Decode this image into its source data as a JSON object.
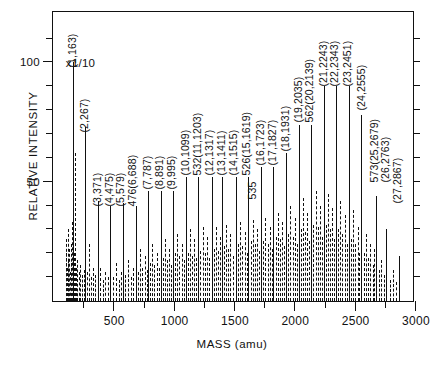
{
  "chart_data": {
    "type": "bar",
    "title": "",
    "xlabel": "MASS (amu)",
    "ylabel": "RELATIVE INTENSITY",
    "xlim": [
      0,
      3000
    ],
    "ylim": [
      0,
      122
    ],
    "grid": false,
    "legend": null,
    "annotations": [
      {
        "text": "x1/10",
        "x": 105,
        "y": 100
      }
    ],
    "xticks": [
      {
        "value": 500,
        "label": "500"
      },
      {
        "value": 1000,
        "label": "1000"
      },
      {
        "value": 1500,
        "label": "1500"
      },
      {
        "value": 2000,
        "label": "2000"
      },
      {
        "value": 2500,
        "label": "2500"
      },
      {
        "value": 3000,
        "label": "3000"
      }
    ],
    "xminor": [
      250,
      750,
      1250,
      1750,
      2250,
      2750
    ],
    "yticks": [
      {
        "value": 50,
        "label": "50"
      },
      {
        "value": 100,
        "label": "100"
      }
    ],
    "yminor": [
      10,
      20,
      30,
      40,
      60,
      70,
      80,
      90,
      110
    ],
    "peak_labels": [
      {
        "text": "(1,163)",
        "x": 163,
        "y": 103
      },
      {
        "text": "(2,267)",
        "x": 267,
        "y": 76
      },
      {
        "text": "(3,371)",
        "x": 371,
        "y": 45
      },
      {
        "text": "(4,475)",
        "x": 470,
        "y": 45
      },
      {
        "text": "(5,579)",
        "x": 566,
        "y": 45
      },
      {
        "text": "476(6,688)",
        "x": 664,
        "y": 45
      },
      {
        "text": "(7,787)",
        "x": 787,
        "y": 52
      },
      {
        "text": "(8,891)",
        "x": 888,
        "y": 52
      },
      {
        "text": "(9,995)",
        "x": 988,
        "y": 52
      },
      {
        "text": "(10,1099)",
        "x": 1099,
        "y": 58
      },
      {
        "text": "532(11,1203)",
        "x": 1200,
        "y": 58
      },
      {
        "text": "(12,1317)",
        "x": 1300,
        "y": 58
      },
      {
        "text": "(13,1411)",
        "x": 1398,
        "y": 58
      },
      {
        "text": "(14,1515)",
        "x": 1497,
        "y": 58
      },
      {
        "text": "526(15,1619)",
        "x": 1608,
        "y": 58
      },
      {
        "text": "535",
        "x": 1660,
        "y": 48
      },
      {
        "text": "(16,1723)",
        "x": 1723,
        "y": 62
      },
      {
        "text": "(17,1827)",
        "x": 1822,
        "y": 62
      },
      {
        "text": "(18,1931)",
        "x": 1931,
        "y": 68
      },
      {
        "text": "(19,2035)",
        "x": 2035,
        "y": 80
      },
      {
        "text": "562(20,2139)",
        "x": 2131,
        "y": 80
      },
      {
        "text": "(21,2243)",
        "x": 2243,
        "y": 95
      },
      {
        "text": "(22,2343)",
        "x": 2341,
        "y": 95
      },
      {
        "text": "(23,2451)",
        "x": 2445,
        "y": 95
      },
      {
        "text": "(24,2555)",
        "x": 2558,
        "y": 85
      },
      {
        "text": "573(25,2679)",
        "x": 2672,
        "y": 55
      },
      {
        "text": "(26,2763)",
        "x": 2762,
        "y": 55
      },
      {
        "text": "(27,2867)",
        "x": 2862,
        "y": 46
      }
    ],
    "peaks": [
      {
        "mass": 104,
        "intensity": 20,
        "style": "dash"
      },
      {
        "mass": 110,
        "intensity": 26,
        "style": "dash"
      },
      {
        "mass": 116,
        "intensity": 14,
        "style": "dash"
      },
      {
        "mass": 122,
        "intensity": 30,
        "style": "dash"
      },
      {
        "mass": 128,
        "intensity": 17,
        "style": "dash"
      },
      {
        "mass": 134,
        "intensity": 22,
        "style": "dash"
      },
      {
        "mass": 140,
        "intensity": 12,
        "style": "dash"
      },
      {
        "mass": 146,
        "intensity": 24,
        "style": "dash"
      },
      {
        "mass": 152,
        "intensity": 16,
        "style": "dash"
      },
      {
        "mass": 158,
        "intensity": 33,
        "style": "dash"
      },
      {
        "mass": 163,
        "intensity": 100,
        "style": "solid"
      },
      {
        "mass": 172,
        "intensity": 20,
        "style": "dash"
      },
      {
        "mass": 180,
        "intensity": 62,
        "style": "dash"
      },
      {
        "mass": 190,
        "intensity": 14,
        "style": "dash"
      },
      {
        "mass": 200,
        "intensity": 17,
        "style": "dash"
      },
      {
        "mass": 212,
        "intensity": 12,
        "style": "dash"
      },
      {
        "mass": 225,
        "intensity": 15,
        "style": "dash"
      },
      {
        "mass": 240,
        "intensity": 11,
        "style": "dash"
      },
      {
        "mass": 255,
        "intensity": 13,
        "style": "dash"
      },
      {
        "mass": 267,
        "intensity": 73,
        "style": "solid"
      },
      {
        "mass": 285,
        "intensity": 12,
        "style": "dash"
      },
      {
        "mass": 300,
        "intensity": 24,
        "style": "dash"
      },
      {
        "mass": 318,
        "intensity": 10,
        "style": "dash"
      },
      {
        "mass": 335,
        "intensity": 14,
        "style": "dash"
      },
      {
        "mass": 352,
        "intensity": 11,
        "style": "dash"
      },
      {
        "mass": 371,
        "intensity": 42,
        "style": "solid"
      },
      {
        "mass": 392,
        "intensity": 14,
        "style": "dash"
      },
      {
        "mass": 412,
        "intensity": 9,
        "style": "dash"
      },
      {
        "mass": 432,
        "intensity": 12,
        "style": "dash"
      },
      {
        "mass": 453,
        "intensity": 10,
        "style": "dash"
      },
      {
        "mass": 475,
        "intensity": 40,
        "style": "solid"
      },
      {
        "mass": 498,
        "intensity": 10,
        "style": "dash"
      },
      {
        "mass": 520,
        "intensity": 16,
        "style": "dash"
      },
      {
        "mass": 543,
        "intensity": 9,
        "style": "dash"
      },
      {
        "mass": 560,
        "intensity": 12,
        "style": "dash"
      },
      {
        "mass": 579,
        "intensity": 41,
        "style": "solid"
      },
      {
        "mass": 600,
        "intensity": 11,
        "style": "dash"
      },
      {
        "mass": 620,
        "intensity": 17,
        "style": "dash"
      },
      {
        "mass": 645,
        "intensity": 10,
        "style": "dash"
      },
      {
        "mass": 666,
        "intensity": 14,
        "style": "dash"
      },
      {
        "mass": 688,
        "intensity": 40,
        "style": "solid"
      },
      {
        "mass": 706,
        "intensity": 12,
        "style": "dash"
      },
      {
        "mass": 722,
        "intensity": 22,
        "style": "dash"
      },
      {
        "mass": 740,
        "intensity": 14,
        "style": "dash"
      },
      {
        "mass": 760,
        "intensity": 19,
        "style": "dash"
      },
      {
        "mass": 775,
        "intensity": 13,
        "style": "dash"
      },
      {
        "mass": 787,
        "intensity": 46,
        "style": "solid"
      },
      {
        "mass": 805,
        "intensity": 16,
        "style": "dash"
      },
      {
        "mass": 822,
        "intensity": 24,
        "style": "dash"
      },
      {
        "mass": 840,
        "intensity": 15,
        "style": "dash"
      },
      {
        "mass": 860,
        "intensity": 20,
        "style": "dash"
      },
      {
        "mass": 876,
        "intensity": 14,
        "style": "dash"
      },
      {
        "mass": 891,
        "intensity": 46,
        "style": "solid"
      },
      {
        "mass": 908,
        "intensity": 18,
        "style": "dash"
      },
      {
        "mass": 925,
        "intensity": 26,
        "style": "dash"
      },
      {
        "mass": 942,
        "intensity": 17,
        "style": "dash"
      },
      {
        "mass": 960,
        "intensity": 22,
        "style": "dash"
      },
      {
        "mass": 978,
        "intensity": 15,
        "style": "dash"
      },
      {
        "mass": 995,
        "intensity": 46,
        "style": "solid"
      },
      {
        "mass": 1012,
        "intensity": 20,
        "style": "dash"
      },
      {
        "mass": 1030,
        "intensity": 28,
        "style": "dash"
      },
      {
        "mass": 1048,
        "intensity": 19,
        "style": "dash"
      },
      {
        "mass": 1065,
        "intensity": 24,
        "style": "dash"
      },
      {
        "mass": 1082,
        "intensity": 17,
        "style": "dash"
      },
      {
        "mass": 1099,
        "intensity": 52,
        "style": "solid"
      },
      {
        "mass": 1118,
        "intensity": 20,
        "style": "dash"
      },
      {
        "mass": 1136,
        "intensity": 30,
        "style": "dash"
      },
      {
        "mass": 1154,
        "intensity": 19,
        "style": "dash"
      },
      {
        "mass": 1172,
        "intensity": 26,
        "style": "dash"
      },
      {
        "mass": 1188,
        "intensity": 18,
        "style": "dash"
      },
      {
        "mass": 1203,
        "intensity": 52,
        "style": "solid"
      },
      {
        "mass": 1222,
        "intensity": 21,
        "style": "dash"
      },
      {
        "mass": 1240,
        "intensity": 31,
        "style": "dash"
      },
      {
        "mass": 1258,
        "intensity": 20,
        "style": "dash"
      },
      {
        "mass": 1276,
        "intensity": 27,
        "style": "dash"
      },
      {
        "mass": 1296,
        "intensity": 18,
        "style": "dash"
      },
      {
        "mass": 1317,
        "intensity": 52,
        "style": "solid"
      },
      {
        "mass": 1332,
        "intensity": 22,
        "style": "dash"
      },
      {
        "mass": 1348,
        "intensity": 31,
        "style": "dash"
      },
      {
        "mass": 1364,
        "intensity": 21,
        "style": "dash"
      },
      {
        "mass": 1382,
        "intensity": 27,
        "style": "dash"
      },
      {
        "mass": 1398,
        "intensity": 52,
        "style": "solid"
      },
      {
        "mass": 1416,
        "intensity": 23,
        "style": "dash"
      },
      {
        "mass": 1434,
        "intensity": 32,
        "style": "dash"
      },
      {
        "mass": 1452,
        "intensity": 22,
        "style": "dash"
      },
      {
        "mass": 1470,
        "intensity": 28,
        "style": "dash"
      },
      {
        "mass": 1488,
        "intensity": 19,
        "style": "dash"
      },
      {
        "mass": 1515,
        "intensity": 52,
        "style": "solid"
      },
      {
        "mass": 1532,
        "intensity": 24,
        "style": "dash"
      },
      {
        "mass": 1550,
        "intensity": 33,
        "style": "dash"
      },
      {
        "mass": 1568,
        "intensity": 23,
        "style": "dash"
      },
      {
        "mass": 1588,
        "intensity": 29,
        "style": "dash"
      },
      {
        "mass": 1605,
        "intensity": 20,
        "style": "dash"
      },
      {
        "mass": 1619,
        "intensity": 52,
        "style": "solid"
      },
      {
        "mass": 1638,
        "intensity": 25,
        "style": "dash"
      },
      {
        "mass": 1656,
        "intensity": 34,
        "style": "dash"
      },
      {
        "mass": 1675,
        "intensity": 24,
        "style": "dash"
      },
      {
        "mass": 1694,
        "intensity": 30,
        "style": "dash"
      },
      {
        "mass": 1710,
        "intensity": 21,
        "style": "dash"
      },
      {
        "mass": 1723,
        "intensity": 56,
        "style": "solid"
      },
      {
        "mass": 1742,
        "intensity": 25,
        "style": "dash"
      },
      {
        "mass": 1760,
        "intensity": 35,
        "style": "dash"
      },
      {
        "mass": 1778,
        "intensity": 24,
        "style": "dash"
      },
      {
        "mass": 1796,
        "intensity": 31,
        "style": "dash"
      },
      {
        "mass": 1812,
        "intensity": 22,
        "style": "dash"
      },
      {
        "mass": 1827,
        "intensity": 56,
        "style": "solid"
      },
      {
        "mass": 1846,
        "intensity": 27,
        "style": "dash"
      },
      {
        "mass": 1864,
        "intensity": 37,
        "style": "dash"
      },
      {
        "mass": 1882,
        "intensity": 26,
        "style": "dash"
      },
      {
        "mass": 1900,
        "intensity": 33,
        "style": "dash"
      },
      {
        "mass": 1916,
        "intensity": 23,
        "style": "dash"
      },
      {
        "mass": 1931,
        "intensity": 62,
        "style": "solid"
      },
      {
        "mass": 1950,
        "intensity": 28,
        "style": "dash"
      },
      {
        "mass": 1968,
        "intensity": 40,
        "style": "dash"
      },
      {
        "mass": 1986,
        "intensity": 27,
        "style": "dash"
      },
      {
        "mass": 2004,
        "intensity": 35,
        "style": "dash"
      },
      {
        "mass": 2020,
        "intensity": 24,
        "style": "dash"
      },
      {
        "mass": 2035,
        "intensity": 74,
        "style": "solid"
      },
      {
        "mass": 2054,
        "intensity": 30,
        "style": "dash"
      },
      {
        "mass": 2072,
        "intensity": 43,
        "style": "dash"
      },
      {
        "mass": 2090,
        "intensity": 29,
        "style": "dash"
      },
      {
        "mass": 2108,
        "intensity": 37,
        "style": "dash"
      },
      {
        "mass": 2124,
        "intensity": 25,
        "style": "dash"
      },
      {
        "mass": 2139,
        "intensity": 74,
        "style": "solid"
      },
      {
        "mass": 2158,
        "intensity": 32,
        "style": "dash"
      },
      {
        "mass": 2176,
        "intensity": 46,
        "style": "dash"
      },
      {
        "mass": 2194,
        "intensity": 31,
        "style": "dash"
      },
      {
        "mass": 2212,
        "intensity": 40,
        "style": "dash"
      },
      {
        "mass": 2228,
        "intensity": 27,
        "style": "dash"
      },
      {
        "mass": 2243,
        "intensity": 90,
        "style": "solid"
      },
      {
        "mass": 2262,
        "intensity": 32,
        "style": "dash"
      },
      {
        "mass": 2280,
        "intensity": 45,
        "style": "dash"
      },
      {
        "mass": 2298,
        "intensity": 30,
        "style": "dash"
      },
      {
        "mass": 2316,
        "intensity": 39,
        "style": "dash"
      },
      {
        "mass": 2330,
        "intensity": 26,
        "style": "dash"
      },
      {
        "mass": 2343,
        "intensity": 90,
        "style": "solid"
      },
      {
        "mass": 2362,
        "intensity": 30,
        "style": "dash"
      },
      {
        "mass": 2380,
        "intensity": 42,
        "style": "dash"
      },
      {
        "mass": 2398,
        "intensity": 28,
        "style": "dash"
      },
      {
        "mass": 2416,
        "intensity": 36,
        "style": "dash"
      },
      {
        "mass": 2434,
        "intensity": 24,
        "style": "dash"
      },
      {
        "mass": 2451,
        "intensity": 90,
        "style": "solid"
      },
      {
        "mass": 2470,
        "intensity": 26,
        "style": "dash"
      },
      {
        "mass": 2488,
        "intensity": 38,
        "style": "dash"
      },
      {
        "mass": 2506,
        "intensity": 24,
        "style": "dash"
      },
      {
        "mass": 2524,
        "intensity": 31,
        "style": "dash"
      },
      {
        "mass": 2540,
        "intensity": 20,
        "style": "dash"
      },
      {
        "mass": 2555,
        "intensity": 78,
        "style": "solid"
      },
      {
        "mass": 2574,
        "intensity": 20,
        "style": "dash"
      },
      {
        "mass": 2592,
        "intensity": 28,
        "style": "dash"
      },
      {
        "mass": 2610,
        "intensity": 18,
        "style": "dash"
      },
      {
        "mass": 2628,
        "intensity": 24,
        "style": "dash"
      },
      {
        "mass": 2648,
        "intensity": 15,
        "style": "dash"
      },
      {
        "mass": 2664,
        "intensity": 22,
        "style": "dash"
      },
      {
        "mass": 2679,
        "intensity": 44,
        "style": "solid"
      },
      {
        "mass": 2700,
        "intensity": 13,
        "style": "dash"
      },
      {
        "mass": 2720,
        "intensity": 17,
        "style": "dash"
      },
      {
        "mass": 2742,
        "intensity": 11,
        "style": "dash"
      },
      {
        "mass": 2763,
        "intensity": 30,
        "style": "solid"
      },
      {
        "mass": 2790,
        "intensity": 9,
        "style": "dash"
      },
      {
        "mass": 2815,
        "intensity": 13,
        "style": "dash"
      },
      {
        "mass": 2840,
        "intensity": 8,
        "style": "dash"
      },
      {
        "mass": 2867,
        "intensity": 19,
        "style": "solid"
      }
    ]
  }
}
